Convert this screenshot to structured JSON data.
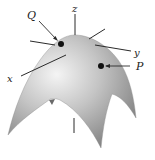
{
  "diagram": {
    "type": "surface-plot",
    "axes": {
      "x_label": "x",
      "y_label": "y",
      "z_label": "z"
    },
    "points": [
      {
        "label": "Q",
        "position": "near apex, left side"
      },
      {
        "label": "P",
        "position": "right side of surface"
      }
    ],
    "colors": {
      "surface_light": "#f2f2f2",
      "surface_mid": "#b0b0b0",
      "surface_dark": "#7a7a7a",
      "line": "#2a2a2a",
      "point": "#111111"
    }
  }
}
